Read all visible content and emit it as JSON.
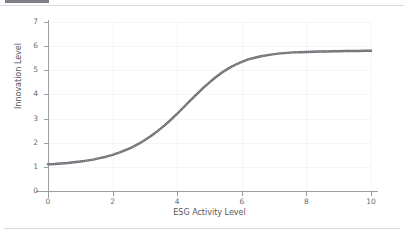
{
  "window": {
    "tab_stub": "",
    "background_color": "#ffffff"
  },
  "chart_data": {
    "type": "line",
    "title": "",
    "xlabel": "ESG Activity Level",
    "ylabel": "Innovation Level",
    "xlim": [
      0,
      10
    ],
    "ylim": [
      0,
      7
    ],
    "xticks": [
      "0",
      "2",
      "4",
      "6",
      "8",
      "10"
    ],
    "xtick_values": [
      0,
      2,
      4,
      6,
      8,
      10
    ],
    "yticks": [
      "0",
      "1",
      "2",
      "3",
      "4",
      "5",
      "6",
      "7"
    ],
    "ytick_values": [
      0,
      1,
      2,
      3,
      4,
      5,
      6,
      7
    ],
    "grid": true,
    "grid_color": "#f4f5f7",
    "legend": null,
    "legend_position": "none",
    "marker": "dot",
    "line_color": "#6b6e73",
    "series": [
      {
        "name": "Innovation Level",
        "x": [
          0.0,
          0.2,
          0.4,
          0.6,
          0.8,
          1.0,
          1.2,
          1.4,
          1.6,
          1.8,
          2.0,
          2.2,
          2.4,
          2.6,
          2.8,
          3.0,
          3.2,
          3.4,
          3.6,
          3.8,
          4.0,
          4.2,
          4.4,
          4.6,
          4.8,
          5.0,
          5.2,
          5.4,
          5.6,
          5.8,
          6.0,
          6.2,
          6.4,
          6.6,
          6.8,
          7.0,
          7.2,
          7.4,
          7.6,
          7.8,
          8.0,
          8.2,
          8.4,
          8.6,
          8.8,
          9.0,
          9.2,
          9.4,
          9.6,
          9.8,
          10.0
        ],
        "y": [
          1.11,
          1.12,
          1.14,
          1.16,
          1.19,
          1.22,
          1.26,
          1.3,
          1.36,
          1.42,
          1.5,
          1.59,
          1.69,
          1.81,
          1.95,
          2.11,
          2.29,
          2.49,
          2.71,
          2.95,
          3.2,
          3.47,
          3.74,
          4.0,
          4.26,
          4.5,
          4.72,
          4.92,
          5.09,
          5.23,
          5.35,
          5.45,
          5.52,
          5.58,
          5.63,
          5.67,
          5.7,
          5.72,
          5.74,
          5.75,
          5.76,
          5.77,
          5.78,
          5.78,
          5.79,
          5.79,
          5.8,
          5.8,
          5.8,
          5.81,
          5.81
        ]
      }
    ],
    "y_start": 1.1,
    "y_end": 5.8
  }
}
